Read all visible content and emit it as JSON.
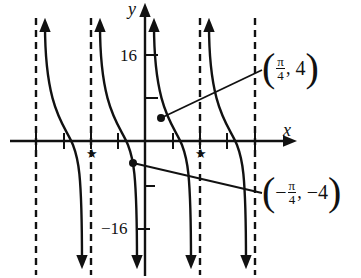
{
  "graph": {
    "x_axis_label": "x",
    "y_axis_label": "y",
    "y_tick_top": "16",
    "y_tick_bottom": "−16",
    "star_marker": "★",
    "point_a": {
      "paren_open": "(",
      "numerator": "π",
      "denominator": "4",
      "sep": ",",
      "y_value": "4",
      "paren_close": ")",
      "sign": ""
    },
    "point_b": {
      "paren_open": "(",
      "sign": "−",
      "numerator": "π",
      "denominator": "4",
      "sep": ",",
      "y_value": "−4",
      "paren_close": ")"
    },
    "colors": {
      "ink": "#111111",
      "background": "#ffffff"
    }
  }
}
